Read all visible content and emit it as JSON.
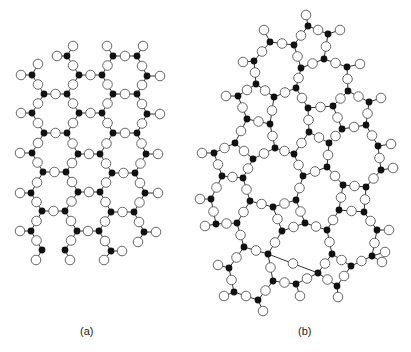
{
  "figure": {
    "panels": [
      {
        "id": "a",
        "label": "(a)",
        "description": "crystalline network",
        "si_nodes": [
          [
            67,
            56
          ],
          [
            113,
            56
          ],
          [
            137,
            56
          ],
          [
            32,
            75
          ],
          [
            79,
            75
          ],
          [
            102,
            75
          ],
          [
            147,
            76
          ],
          [
            44,
            94
          ],
          [
            67,
            94
          ],
          [
            113,
            94
          ],
          [
            137,
            94
          ],
          [
            32,
            113
          ],
          [
            79,
            113
          ],
          [
            102,
            113
          ],
          [
            147,
            114
          ],
          [
            44,
            133
          ],
          [
            67,
            133
          ],
          [
            113,
            133
          ],
          [
            137,
            133
          ],
          [
            32,
            153
          ],
          [
            78,
            154
          ],
          [
            100,
            154
          ],
          [
            146,
            154
          ],
          [
            43,
            172
          ],
          [
            66,
            172
          ],
          [
            112,
            173
          ],
          [
            135,
            173
          ],
          [
            31,
            193
          ],
          [
            78,
            192
          ],
          [
            100,
            192
          ],
          [
            145,
            193
          ],
          [
            42,
            211
          ],
          [
            65,
            211
          ],
          [
            111,
            212
          ],
          [
            134,
            212
          ],
          [
            31,
            231
          ],
          [
            77,
            231
          ],
          [
            99,
            231
          ],
          [
            144,
            232
          ],
          [
            42,
            250
          ],
          [
            65,
            250
          ],
          [
            111,
            251
          ]
        ],
        "bonds": [
          [
            0,
            4
          ],
          [
            1,
            5
          ],
          [
            1,
            2
          ],
          [
            2,
            6
          ],
          [
            3,
            7
          ],
          [
            4,
            8
          ],
          [
            5,
            9
          ],
          [
            6,
            10
          ],
          [
            4,
            5
          ],
          [
            7,
            8
          ],
          [
            9,
            10
          ],
          [
            7,
            11
          ],
          [
            8,
            12
          ],
          [
            9,
            13
          ],
          [
            10,
            14
          ],
          [
            11,
            15
          ],
          [
            12,
            16
          ],
          [
            13,
            17
          ],
          [
            14,
            18
          ],
          [
            12,
            13
          ],
          [
            15,
            16
          ],
          [
            17,
            18
          ],
          [
            15,
            19
          ],
          [
            16,
            20
          ],
          [
            17,
            21
          ],
          [
            18,
            22
          ],
          [
            19,
            23
          ],
          [
            20,
            24
          ],
          [
            21,
            25
          ],
          [
            22,
            26
          ],
          [
            20,
            21
          ],
          [
            23,
            24
          ],
          [
            25,
            26
          ],
          [
            23,
            27
          ],
          [
            24,
            28
          ],
          [
            25,
            29
          ],
          [
            26,
            30
          ],
          [
            27,
            31
          ],
          [
            28,
            32
          ],
          [
            29,
            33
          ],
          [
            30,
            34
          ],
          [
            28,
            29
          ],
          [
            31,
            32
          ],
          [
            33,
            34
          ],
          [
            31,
            35
          ],
          [
            32,
            36
          ],
          [
            33,
            37
          ],
          [
            34,
            38
          ],
          [
            35,
            39
          ],
          [
            36,
            40
          ],
          [
            37,
            41
          ],
          [
            36,
            37
          ]
        ],
        "terminals": [
          [
            0,
            [
              73,
              46
            ]
          ],
          [
            0,
            [
              57,
              56
            ]
          ],
          [
            1,
            [
              107,
              46
            ]
          ],
          [
            2,
            [
              143,
              46
            ]
          ],
          [
            3,
            [
              21,
              75
            ]
          ],
          [
            3,
            [
              38,
              64
            ]
          ],
          [
            6,
            [
              160,
              76
            ]
          ],
          [
            11,
            [
              21,
              113
            ]
          ],
          [
            14,
            [
              160,
              114
            ]
          ],
          [
            19,
            [
              20,
              153
            ]
          ],
          [
            22,
            [
              158,
              154
            ]
          ],
          [
            27,
            [
              20,
              193
            ]
          ],
          [
            30,
            [
              158,
              193
            ]
          ],
          [
            35,
            [
              20,
              231
            ]
          ],
          [
            38,
            [
              156,
              232
            ]
          ],
          [
            38,
            [
              138,
              242
            ]
          ],
          [
            39,
            [
              36,
              260
            ]
          ],
          [
            40,
            [
              70,
              260
            ]
          ],
          [
            41,
            [
              122,
              251
            ]
          ],
          [
            41,
            [
              104,
              260
            ]
          ]
        ]
      },
      {
        "id": "b",
        "label": "(b)",
        "description": "amorphous network",
        "si_nodes": [
          [
            308,
            26
          ],
          [
            328,
            34
          ],
          [
            270,
            42
          ],
          [
            294,
            45
          ],
          [
            254,
            61
          ],
          [
            324,
            59
          ],
          [
            301,
            68
          ],
          [
            347,
            67
          ],
          [
            256,
            84
          ],
          [
            296,
            88
          ],
          [
            274,
            97
          ],
          [
            238,
            96
          ],
          [
            348,
            91
          ],
          [
            369,
            102
          ],
          [
            247,
            119
          ],
          [
            270,
            124
          ],
          [
            308,
            108
          ],
          [
            333,
            106
          ],
          [
            366,
            125
          ],
          [
            342,
            129
          ],
          [
            309,
            132
          ],
          [
            235,
            143
          ],
          [
            275,
            148
          ],
          [
            214,
            153
          ],
          [
            253,
            159
          ],
          [
            294,
            154
          ],
          [
            329,
            143
          ],
          [
            378,
            146
          ],
          [
            222,
            176
          ],
          [
            243,
            178
          ],
          [
            303,
            176
          ],
          [
            327,
            167
          ],
          [
            343,
            185
          ],
          [
            366,
            187
          ],
          [
            381,
            170
          ],
          [
            211,
            199
          ],
          [
            250,
            201
          ],
          [
            273,
            207
          ],
          [
            296,
            200
          ],
          [
            339,
            210
          ],
          [
            364,
            212
          ],
          [
            216,
            224
          ],
          [
            237,
            223
          ],
          [
            282,
            231
          ],
          [
            305,
            223
          ],
          [
            327,
            230
          ],
          [
            377,
            230
          ],
          [
            244,
            247
          ],
          [
            268,
            254
          ],
          [
            332,
            254
          ],
          [
            372,
            256
          ],
          [
            351,
            266
          ],
          [
            318,
            273
          ],
          [
            229,
            268
          ],
          [
            273,
            281
          ],
          [
            296,
            284
          ],
          [
            337,
            286
          ],
          [
            234,
            292
          ],
          [
            258,
            300
          ]
        ],
        "bonds": [
          [
            0,
            1
          ],
          [
            0,
            3
          ],
          [
            3,
            2
          ],
          [
            2,
            4
          ],
          [
            3,
            6
          ],
          [
            1,
            5
          ],
          [
            5,
            6
          ],
          [
            5,
            7
          ],
          [
            4,
            8
          ],
          [
            6,
            9
          ],
          [
            8,
            10
          ],
          [
            9,
            10
          ],
          [
            8,
            11
          ],
          [
            9,
            16
          ],
          [
            7,
            12
          ],
          [
            12,
            13
          ],
          [
            12,
            17
          ],
          [
            11,
            14
          ],
          [
            14,
            15
          ],
          [
            10,
            15
          ],
          [
            16,
            17
          ],
          [
            16,
            20
          ],
          [
            17,
            19
          ],
          [
            13,
            18
          ],
          [
            18,
            19
          ],
          [
            14,
            21
          ],
          [
            15,
            22
          ],
          [
            19,
            26
          ],
          [
            20,
            26
          ],
          [
            20,
            25
          ],
          [
            21,
            23
          ],
          [
            21,
            24
          ],
          [
            22,
            24
          ],
          [
            22,
            25
          ],
          [
            18,
            27
          ],
          [
            26,
            31
          ],
          [
            23,
            28
          ],
          [
            24,
            29
          ],
          [
            28,
            29
          ],
          [
            25,
            30
          ],
          [
            30,
            31
          ],
          [
            31,
            32
          ],
          [
            32,
            33
          ],
          [
            27,
            34
          ],
          [
            33,
            34
          ],
          [
            28,
            35
          ],
          [
            29,
            36
          ],
          [
            36,
            37
          ],
          [
            30,
            38
          ],
          [
            37,
            38
          ],
          [
            32,
            39
          ],
          [
            33,
            40
          ],
          [
            39,
            40
          ],
          [
            35,
            41
          ],
          [
            41,
            42
          ],
          [
            36,
            42
          ],
          [
            37,
            43
          ],
          [
            38,
            44
          ],
          [
            43,
            44
          ],
          [
            44,
            45
          ],
          [
            39,
            45
          ],
          [
            40,
            46
          ],
          [
            42,
            47
          ],
          [
            43,
            48
          ],
          [
            47,
            48
          ],
          [
            45,
            49
          ],
          [
            46,
            50
          ],
          [
            49,
            51
          ],
          [
            50,
            51
          ],
          [
            48,
            52
          ],
          [
            49,
            52
          ],
          [
            47,
            53
          ],
          [
            53,
            57
          ],
          [
            48,
            54
          ],
          [
            54,
            55
          ],
          [
            55,
            52
          ],
          [
            57,
            58
          ],
          [
            54,
            58
          ],
          [
            51,
            56
          ],
          [
            52,
            56
          ]
        ],
        "terminals": [
          [
            0,
            [
              306,
              15
            ]
          ],
          [
            1,
            [
              340,
              30
            ]
          ],
          [
            2,
            [
              264,
              30
            ]
          ],
          [
            4,
            [
              243,
              62
            ]
          ],
          [
            7,
            [
              360,
              64
            ]
          ],
          [
            11,
            [
              226,
              96
            ]
          ],
          [
            13,
            [
              381,
              98
            ]
          ],
          [
            23,
            [
              202,
              153
            ]
          ],
          [
            27,
            [
              391,
              144
            ]
          ],
          [
            34,
            [
              393,
              168
            ]
          ],
          [
            35,
            [
              200,
              199
            ]
          ],
          [
            41,
            [
              205,
              226
            ]
          ],
          [
            46,
            [
              389,
              230
            ]
          ],
          [
            50,
            [
              382,
              262
            ]
          ],
          [
            53,
            [
              218,
              265
            ]
          ],
          [
            56,
            [
              338,
              297
            ]
          ],
          [
            57,
            [
              224,
              296
            ]
          ],
          [
            58,
            [
              263,
              311
            ]
          ],
          [
            55,
            [
              300,
              296
            ]
          ],
          [
            50,
            [
              385,
              252
            ]
          ]
        ]
      }
    ],
    "labels": {
      "a": "(a)",
      "b": "(b)"
    },
    "style": {
      "si_color": "#111111",
      "o_fill": "#ffffff",
      "o_stroke": "#555555",
      "bond_color": "#333333",
      "si_radius": 3.4,
      "o_radius": 4.8
    }
  }
}
